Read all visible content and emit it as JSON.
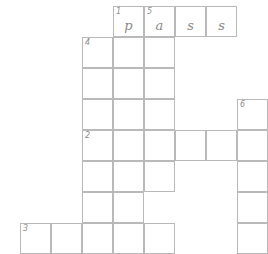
{
  "puzzle": {
    "type": "crossword",
    "cell_size": 31,
    "origin_x": 20,
    "origin_y": 6,
    "grid_cols": 8,
    "grid_rows": 8,
    "border_color": "#b9b9b9",
    "number_color": "#8d8d8d",
    "letter_color": "#8a8a8a",
    "background_color": "#ffffff",
    "clue_numbers": [
      1,
      2,
      3,
      4,
      5,
      6
    ],
    "filled_word": "pass",
    "cells": [
      {
        "col": 3,
        "row": 0,
        "number": "1",
        "letter": "p"
      },
      {
        "col": 4,
        "row": 0,
        "number": "5",
        "letter": "a"
      },
      {
        "col": 5,
        "row": 0,
        "number": "",
        "letter": "s"
      },
      {
        "col": 6,
        "row": 0,
        "number": "",
        "letter": "s"
      },
      {
        "col": 2,
        "row": 1,
        "number": "4",
        "letter": ""
      },
      {
        "col": 3,
        "row": 1,
        "number": "",
        "letter": ""
      },
      {
        "col": 4,
        "row": 1,
        "number": "",
        "letter": ""
      },
      {
        "col": 2,
        "row": 2,
        "number": "",
        "letter": ""
      },
      {
        "col": 3,
        "row": 2,
        "number": "",
        "letter": ""
      },
      {
        "col": 4,
        "row": 2,
        "number": "",
        "letter": ""
      },
      {
        "col": 2,
        "row": 3,
        "number": "",
        "letter": ""
      },
      {
        "col": 3,
        "row": 3,
        "number": "",
        "letter": ""
      },
      {
        "col": 4,
        "row": 3,
        "number": "",
        "letter": ""
      },
      {
        "col": 7,
        "row": 3,
        "number": "6",
        "letter": ""
      },
      {
        "col": 2,
        "row": 4,
        "number": "2",
        "letter": ""
      },
      {
        "col": 3,
        "row": 4,
        "number": "",
        "letter": ""
      },
      {
        "col": 4,
        "row": 4,
        "number": "",
        "letter": ""
      },
      {
        "col": 5,
        "row": 4,
        "number": "",
        "letter": ""
      },
      {
        "col": 6,
        "row": 4,
        "number": "",
        "letter": ""
      },
      {
        "col": 7,
        "row": 4,
        "number": "",
        "letter": ""
      },
      {
        "col": 2,
        "row": 5,
        "number": "",
        "letter": ""
      },
      {
        "col": 3,
        "row": 5,
        "number": "",
        "letter": ""
      },
      {
        "col": 4,
        "row": 5,
        "number": "",
        "letter": ""
      },
      {
        "col": 7,
        "row": 5,
        "number": "",
        "letter": ""
      },
      {
        "col": 2,
        "row": 6,
        "number": "",
        "letter": ""
      },
      {
        "col": 3,
        "row": 6,
        "number": "",
        "letter": ""
      },
      {
        "col": 7,
        "row": 6,
        "number": "",
        "letter": ""
      },
      {
        "col": 0,
        "row": 7,
        "number": "3",
        "letter": ""
      },
      {
        "col": 1,
        "row": 7,
        "number": "",
        "letter": ""
      },
      {
        "col": 2,
        "row": 7,
        "number": "",
        "letter": ""
      },
      {
        "col": 3,
        "row": 7,
        "number": "",
        "letter": ""
      },
      {
        "col": 4,
        "row": 7,
        "number": "",
        "letter": ""
      },
      {
        "col": 7,
        "row": 7,
        "number": "",
        "letter": ""
      }
    ]
  }
}
